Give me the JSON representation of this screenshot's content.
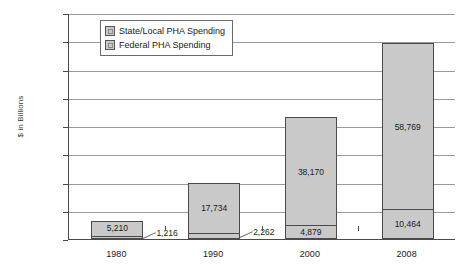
{
  "chart_data": {
    "type": "bar",
    "subtype": "stacked-bar",
    "title": "",
    "xlabel": "",
    "ylabel": "$ in Billions",
    "ylim": [
      0,
      80000
    ],
    "ytick_step": 10000,
    "grid": true,
    "legend_position": "top-left-inside",
    "categories": [
      "1980",
      "1990",
      "2000",
      "2008"
    ],
    "ytick_labels": [
      "80,000",
      "70,000",
      "60,000",
      "50,000",
      "40,000",
      "30,000",
      "20,000",
      "10,000",
      "0"
    ],
    "ytick_values": [
      80000,
      70000,
      60000,
      50000,
      40000,
      30000,
      20000,
      10000,
      0
    ],
    "series": [
      {
        "name": "Federal PHA Spending",
        "values": [
          5210,
          17734,
          38170,
          58769
        ],
        "labels": [
          "5,210",
          "17,734",
          "38,170",
          "58,769"
        ],
        "color": "#c9c9c9"
      },
      {
        "name": "State/Local PHA Spending",
        "values": [
          1216,
          2262,
          4879,
          10464
        ],
        "labels": [
          "1,216",
          "2,262",
          "4,879",
          "10,464"
        ],
        "color": "#c9c9c9"
      }
    ],
    "callouts": [
      {
        "text": "1,216",
        "category": "1980"
      },
      {
        "text": "2,262",
        "category": "1990"
      }
    ]
  },
  "legend": {
    "items": [
      {
        "label": "State/Local PHA Spending"
      },
      {
        "label": "Federal PHA Spending"
      }
    ]
  }
}
